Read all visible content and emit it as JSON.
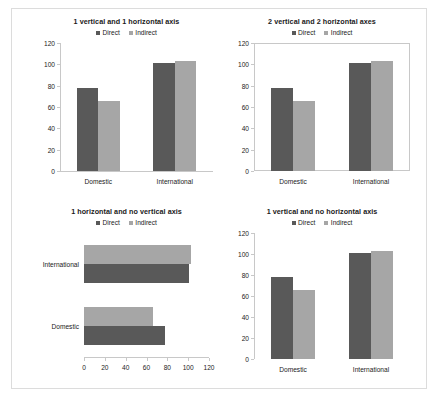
{
  "figure": {
    "background": "#ffffff",
    "border_color": "#dcdcdc",
    "colors": {
      "direct": "#595959",
      "indirect": "#a6a6a6",
      "axis": "#c8c8c8",
      "text": "#1a1a1a"
    },
    "series_names": {
      "direct": "Direct",
      "indirect": "Indirect"
    }
  },
  "chart_data": [
    {
      "id": "chart-top-left",
      "type": "bar",
      "orientation": "vertical",
      "title": "1 vertical and 1 horizontal axis",
      "categories": [
        "Domestic",
        "International"
      ],
      "series": [
        {
          "name": "Direct",
          "values": [
            78,
            101
          ],
          "color": "#595959"
        },
        {
          "name": "Indirect",
          "values": [
            66,
            103
          ],
          "color": "#a6a6a6"
        }
      ],
      "ylim": [
        0,
        120
      ],
      "yticks": [
        0,
        20,
        40,
        60,
        80,
        100,
        120
      ],
      "ytick_labels": [
        "0",
        "20",
        "40",
        "60",
        "80",
        "100",
        "120"
      ],
      "xlabel": "",
      "ylabel": "",
      "grid": false,
      "legend_position": "top-center",
      "axes_shown": {
        "left": true,
        "bottom": true,
        "right": false,
        "top": false
      }
    },
    {
      "id": "chart-top-right",
      "type": "bar",
      "orientation": "vertical",
      "title": "2 vertical and 2 horizontal axes",
      "categories": [
        "Domestic",
        "International"
      ],
      "series": [
        {
          "name": "Direct",
          "values": [
            78,
            101
          ],
          "color": "#595959"
        },
        {
          "name": "Indirect",
          "values": [
            66,
            103
          ],
          "color": "#a6a6a6"
        }
      ],
      "ylim": [
        0,
        120
      ],
      "yticks": [
        0,
        20,
        40,
        60,
        80,
        100,
        120
      ],
      "ytick_labels": [
        "0",
        "20",
        "40",
        "60",
        "80",
        "100",
        "120"
      ],
      "xlabel": "",
      "ylabel": "",
      "grid": false,
      "legend_position": "top-center",
      "axes_shown": {
        "left": true,
        "bottom": true,
        "right": true,
        "top": true
      }
    },
    {
      "id": "chart-bottom-left",
      "type": "bar",
      "orientation": "horizontal",
      "title": "1 horizontal and no vertical axis",
      "categories": [
        "Domestic",
        "International"
      ],
      "series": [
        {
          "name": "Direct",
          "values": [
            78,
            101
          ],
          "color": "#595959"
        },
        {
          "name": "Indirect",
          "values": [
            66,
            103
          ],
          "color": "#a6a6a6"
        }
      ],
      "xlim": [
        0,
        120
      ],
      "xticks": [
        0,
        20,
        40,
        60,
        80,
        100,
        120
      ],
      "xtick_labels": [
        "0",
        "20",
        "40",
        "60",
        "80",
        "100",
        "120"
      ],
      "xlabel": "",
      "ylabel": "",
      "grid": false,
      "legend_position": "top-center",
      "axes_shown": {
        "left": false,
        "bottom": true,
        "right": false,
        "top": false
      }
    },
    {
      "id": "chart-bottom-right",
      "type": "bar",
      "orientation": "vertical",
      "title": "1 vertical and no horizontal axis",
      "categories": [
        "Domestic",
        "International"
      ],
      "series": [
        {
          "name": "Direct",
          "values": [
            78,
            101
          ],
          "color": "#595959"
        },
        {
          "name": "Indirect",
          "values": [
            66,
            103
          ],
          "color": "#a6a6a6"
        }
      ],
      "ylim": [
        0,
        120
      ],
      "yticks": [
        0,
        20,
        40,
        60,
        80,
        100,
        120
      ],
      "ytick_labels": [
        "0",
        "20",
        "40",
        "60",
        "80",
        "100",
        "120"
      ],
      "xlabel": "",
      "ylabel": "",
      "grid": false,
      "legend_position": "top-center",
      "axes_shown": {
        "left": true,
        "bottom": false,
        "right": false,
        "top": false
      }
    }
  ]
}
